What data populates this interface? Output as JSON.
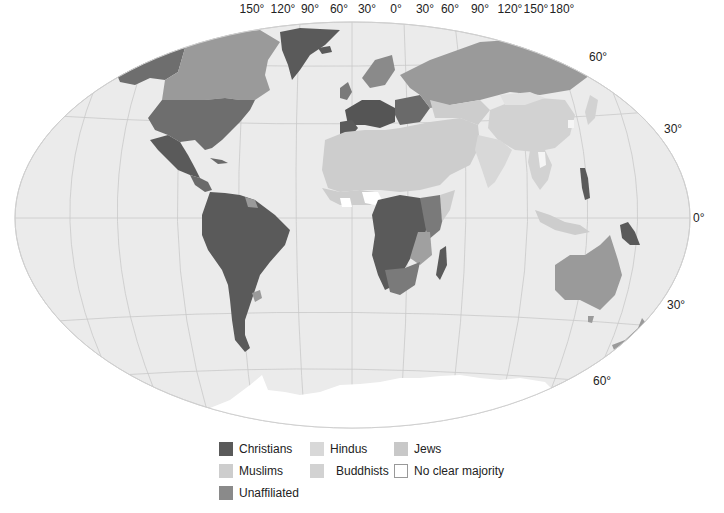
{
  "map": {
    "projection": "Winkel tripel (world)",
    "ocean_color": "#ebebeb",
    "graticule_color": "#c9c9c9",
    "longitude_labels": [
      "150°",
      "120°",
      "90°",
      "60°",
      "30°",
      "0°",
      "30°",
      "60°",
      "90°",
      "120°",
      "150°",
      "180°"
    ],
    "latitude_labels": [
      {
        "label": "60°",
        "position": "north-east"
      },
      {
        "label": "30°",
        "position": "north-east"
      },
      {
        "label": "0°",
        "position": "east"
      },
      {
        "label": "30°",
        "position": "south-east"
      },
      {
        "label": "60°",
        "position": "south-east"
      }
    ]
  },
  "legend": {
    "items": [
      {
        "label": "Christians",
        "color": "#5a5a5a"
      },
      {
        "label": "Hindus",
        "color": "#d8d8d8"
      },
      {
        "label": "Jews",
        "color": "#c8c8c8"
      },
      {
        "label": "Muslims",
        "color": "#cdcdcd"
      },
      {
        "label": "Buddhists",
        "color": "#d2d2d2"
      },
      {
        "label": "No clear majority",
        "color": "#ffffff"
      },
      {
        "label": "Unaffiliated",
        "color": "#8a8a8a"
      }
    ]
  },
  "colors": {
    "christians": "#5a5a5a",
    "muslims": "#cdcdcd",
    "unaffiliated": "#8a8a8a",
    "hindus": "#d8d8d8",
    "buddhists": "#d2d2d2",
    "jews": "#c8c8c8",
    "no_majority": "#ffffff",
    "other_christian_mid": "#7a7a7a",
    "antarctica": "#ffffff"
  }
}
